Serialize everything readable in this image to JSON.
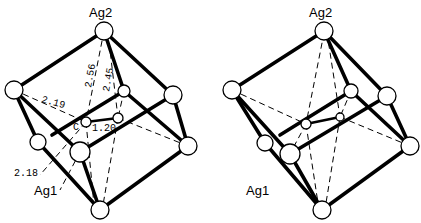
{
  "diagram": {
    "panels": [
      {
        "id": "left",
        "atom_labels": {
          "top": "Ag2",
          "bottom": "Ag1"
        },
        "carbon_label": "C",
        "distances": {
          "ag2_c_a": "2.56",
          "ag2_c_b": "2.45",
          "ag_c_left": "2.19",
          "c_c": "1.20",
          "ag1_c": "2.18"
        }
      },
      {
        "id": "right",
        "atom_labels": {
          "top": "Ag2",
          "bottom": "Ag1"
        }
      }
    ],
    "colors": {
      "line": "#000000",
      "atom_fill": "#ffffff",
      "background": "#ffffff"
    }
  }
}
